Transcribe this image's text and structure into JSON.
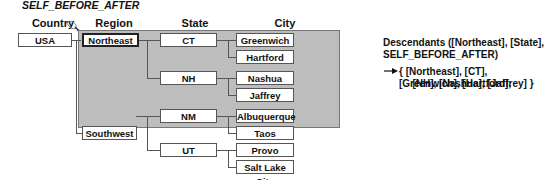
{
  "title": "SELF_BEFORE_AFTER",
  "headers": {
    "country": "Country",
    "region": "Region",
    "state": "State",
    "city": "City"
  },
  "tree": {
    "country": "USA",
    "regions": [
      {
        "name": "Northeast",
        "selected": true,
        "states": [
          {
            "name": "CT",
            "cities": [
              "Greenwich",
              "Hartford"
            ]
          },
          {
            "name": "NH",
            "cities": [
              "Nashua",
              "Jaffrey"
            ]
          }
        ]
      },
      {
        "name": "Southwest",
        "selected": false,
        "states": [
          {
            "name": "NM",
            "cities": [
              "Albuquerque",
              "Taos"
            ]
          },
          {
            "name": "UT",
            "cities": [
              "Provo",
              "Salt Lake City"
            ]
          }
        ]
      }
    ]
  },
  "result": {
    "expression_line1": "Descendants ([Northeast], [State],",
    "expression_line2": "SELF_BEFORE_AFTER)",
    "output_line1": "{ [Northeast], [CT], [Greenwich], [Hartford],",
    "output_line2": "[NH], [Nashua], [Jaffrey] }"
  },
  "colors": {
    "highlight_fill": "#bdbdbd",
    "line": "#555555"
  }
}
